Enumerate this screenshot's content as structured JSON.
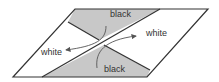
{
  "diagram": {
    "colors": {
      "background": "#ffffff",
      "outline": "#333333",
      "shaded_region": "#c8c8c8",
      "arrow": "#555555",
      "text": "#333333"
    },
    "labels": {
      "top_region": "black",
      "bottom_region": "black",
      "right_region": "white",
      "left_region": "white"
    }
  }
}
